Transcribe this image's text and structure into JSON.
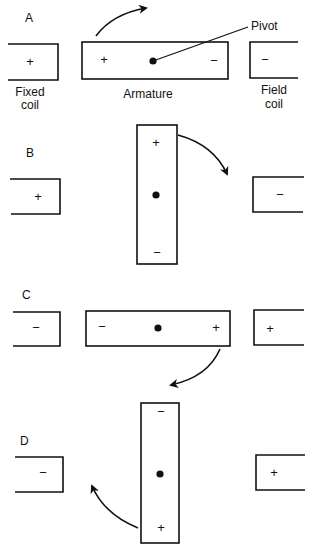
{
  "colors": {
    "ink": "#111111",
    "background": "#ffffff"
  },
  "labels": {
    "fixed_coil_line1": "Fixed",
    "fixed_coil_line2": "coil",
    "armature": "Armature",
    "field_coil_line1": "Field",
    "field_coil_line2": "coil",
    "pivot": "Pivot"
  },
  "panels": [
    {
      "id": "A",
      "label": "A",
      "armature_orientation": "horizontal",
      "left_coil_sign": "+",
      "armature_left_sign": "+",
      "armature_right_sign": "−",
      "right_coil_sign": "−",
      "rotation": "clockwise"
    },
    {
      "id": "B",
      "label": "B",
      "armature_orientation": "vertical",
      "left_coil_sign": "+",
      "armature_top_sign": "+",
      "armature_bottom_sign": "−",
      "right_coil_sign": "−",
      "rotation": "clockwise"
    },
    {
      "id": "C",
      "label": "C",
      "armature_orientation": "horizontal",
      "left_coil_sign": "−",
      "armature_left_sign": "−",
      "armature_right_sign": "+",
      "right_coil_sign": "+",
      "rotation": "clockwise"
    },
    {
      "id": "D",
      "label": "D",
      "armature_orientation": "vertical",
      "left_coil_sign": "−",
      "armature_top_sign": "−",
      "armature_bottom_sign": "+",
      "right_coil_sign": "+",
      "rotation": "clockwise"
    }
  ]
}
